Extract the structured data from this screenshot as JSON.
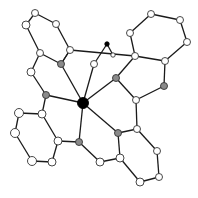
{
  "diagram": {
    "type": "ball-and-stick molecular structure",
    "legend_colors": {
      "metal_center": "#000000",
      "donor_atom": "#8a8a8a",
      "carbon": "#ffffff",
      "small_black": "#000000"
    },
    "atoms": [
      {
        "id": "M",
        "x": 83,
        "y": 103,
        "r": 5.5,
        "kind": "black"
      },
      {
        "id": "N1",
        "x": 61,
        "y": 64,
        "r": 3.5,
        "kind": "gray"
      },
      {
        "id": "N2",
        "x": 116,
        "y": 78,
        "r": 3.5,
        "kind": "gray"
      },
      {
        "id": "N3",
        "x": 46,
        "y": 95,
        "r": 3.5,
        "kind": "gray"
      },
      {
        "id": "N4",
        "x": 79,
        "y": 142,
        "r": 3.5,
        "kind": "gray"
      },
      {
        "id": "N5",
        "x": 118,
        "y": 133,
        "r": 3.5,
        "kind": "gray"
      },
      {
        "id": "N6",
        "x": 164,
        "y": 86,
        "r": 3.5,
        "kind": "gray"
      },
      {
        "id": "X1",
        "x": 107,
        "y": 44,
        "r": 2.2,
        "kind": "black"
      },
      {
        "id": "X2",
        "x": 113,
        "y": 55,
        "r": 2.2,
        "kind": "white"
      },
      {
        "id": "C1",
        "x": 35,
        "y": 13,
        "r": 3.5,
        "kind": "white"
      },
      {
        "id": "C2",
        "x": 26,
        "y": 25,
        "r": 4,
        "kind": "white"
      },
      {
        "id": "C3",
        "x": 56,
        "y": 24,
        "r": 3.5,
        "kind": "white"
      },
      {
        "id": "C4",
        "x": 40,
        "y": 53,
        "r": 3.5,
        "kind": "white"
      },
      {
        "id": "C5",
        "x": 70,
        "y": 50,
        "r": 3.5,
        "kind": "white"
      },
      {
        "id": "C6",
        "x": 31,
        "y": 72,
        "r": 4,
        "kind": "white"
      },
      {
        "id": "C7",
        "x": 94,
        "y": 64,
        "r": 3.5,
        "kind": "white"
      },
      {
        "id": "C8",
        "x": 130,
        "y": 33,
        "r": 3.5,
        "kind": "white"
      },
      {
        "id": "C9",
        "x": 151,
        "y": 14,
        "r": 3.5,
        "kind": "white"
      },
      {
        "id": "C10",
        "x": 180,
        "y": 20,
        "r": 3.5,
        "kind": "white"
      },
      {
        "id": "C11",
        "x": 187,
        "y": 42,
        "r": 3.5,
        "kind": "white"
      },
      {
        "id": "C12",
        "x": 165,
        "y": 61,
        "r": 3.5,
        "kind": "white"
      },
      {
        "id": "C13",
        "x": 135,
        "y": 56,
        "r": 3.5,
        "kind": "white"
      },
      {
        "id": "C14",
        "x": 136,
        "y": 100,
        "r": 3.5,
        "kind": "white"
      },
      {
        "id": "C15",
        "x": 137,
        "y": 129,
        "r": 3.5,
        "kind": "white"
      },
      {
        "id": "C16",
        "x": 157,
        "y": 151,
        "r": 3.5,
        "kind": "white"
      },
      {
        "id": "C17",
        "x": 159,
        "y": 177,
        "r": 3.5,
        "kind": "white"
      },
      {
        "id": "C18",
        "x": 140,
        "y": 182,
        "r": 4,
        "kind": "white"
      },
      {
        "id": "C19",
        "x": 120,
        "y": 158,
        "r": 4,
        "kind": "white"
      },
      {
        "id": "C20",
        "x": 100,
        "y": 162,
        "r": 4,
        "kind": "white"
      },
      {
        "id": "C21",
        "x": 42,
        "y": 114,
        "r": 4,
        "kind": "white"
      },
      {
        "id": "C22",
        "x": 19,
        "y": 113,
        "r": 4.5,
        "kind": "white"
      },
      {
        "id": "C23",
        "x": 15,
        "y": 133,
        "r": 4.5,
        "kind": "white"
      },
      {
        "id": "C24",
        "x": 32,
        "y": 161,
        "r": 4.5,
        "kind": "white"
      },
      {
        "id": "C25",
        "x": 52,
        "y": 162,
        "r": 4,
        "kind": "white"
      },
      {
        "id": "C26",
        "x": 58,
        "y": 141,
        "r": 4,
        "kind": "white"
      }
    ],
    "bonds": [
      [
        "M",
        "N1"
      ],
      [
        "M",
        "N2"
      ],
      [
        "M",
        "N3"
      ],
      [
        "M",
        "N4"
      ],
      [
        "M",
        "N5"
      ],
      [
        "M",
        "C7"
      ],
      [
        "C1",
        "C2"
      ],
      [
        "C1",
        "C3"
      ],
      [
        "C3",
        "C5"
      ],
      [
        "C2",
        "C4"
      ],
      [
        "C4",
        "N1"
      ],
      [
        "C5",
        "N1"
      ],
      [
        "C4",
        "C6"
      ],
      [
        "C6",
        "N3"
      ],
      [
        "C5",
        "C13"
      ],
      [
        "N1",
        "C5"
      ],
      [
        "C7",
        "X1"
      ],
      [
        "X1",
        "X2"
      ],
      [
        "N2",
        "C13"
      ],
      [
        "N2",
        "C14"
      ],
      [
        "C13",
        "C8"
      ],
      [
        "C8",
        "C9"
      ],
      [
        "C9",
        "C10"
      ],
      [
        "C10",
        "C11"
      ],
      [
        "C11",
        "C12"
      ],
      [
        "C12",
        "C13"
      ],
      [
        "C12",
        "N6"
      ],
      [
        "N6",
        "C14"
      ],
      [
        "C14",
        "C15"
      ],
      [
        "C15",
        "N5"
      ],
      [
        "C15",
        "C16"
      ],
      [
        "C16",
        "C17"
      ],
      [
        "C17",
        "C18"
      ],
      [
        "C18",
        "C19"
      ],
      [
        "C19",
        "N5"
      ],
      [
        "C19",
        "C20"
      ],
      [
        "C20",
        "N4"
      ],
      [
        "N4",
        "C26"
      ],
      [
        "N3",
        "C21"
      ],
      [
        "C21",
        "C22"
      ],
      [
        "C22",
        "C23"
      ],
      [
        "C23",
        "C24"
      ],
      [
        "C24",
        "C25"
      ],
      [
        "C25",
        "C26"
      ],
      [
        "C26",
        "C21"
      ]
    ]
  }
}
